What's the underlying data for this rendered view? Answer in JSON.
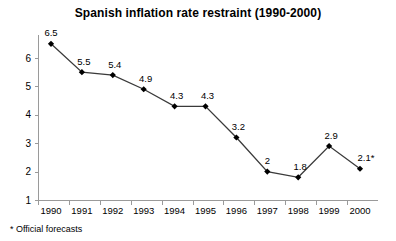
{
  "chart_data": {
    "type": "line",
    "title": "Spanish inflation rate restraint (1990-2000)",
    "xlabel": "",
    "ylabel": "",
    "categories": [
      "1990",
      "1991",
      "1992",
      "1993",
      "1994",
      "1995",
      "1996",
      "1997",
      "1998",
      "1999",
      "2000"
    ],
    "values": [
      6.5,
      5.5,
      5.4,
      4.9,
      4.3,
      4.3,
      3.2,
      2,
      1.8,
      2.9,
      2.1
    ],
    "point_labels": [
      "6.5",
      "5.5",
      "5.4",
      "4.9",
      "4.3",
      "4.3",
      "3.2",
      "2",
      "1.8",
      "2.9",
      "2.1*"
    ],
    "yticks": [
      1,
      2,
      3,
      4,
      5,
      6
    ],
    "ytick_labels": [
      "1",
      "2",
      "3",
      "4",
      "5",
      "6"
    ],
    "ylim": [
      1,
      6.8
    ],
    "grid": false,
    "legend": null,
    "annotation": "* Official forecasts",
    "marker": "diamond",
    "line_color": "#3a3a3a",
    "marker_color": "#000000",
    "axis_color": "#9a9a9a",
    "text_color": "#000000",
    "background": "#ffffff"
  },
  "footnote": {
    "text": "* Official forecasts"
  }
}
